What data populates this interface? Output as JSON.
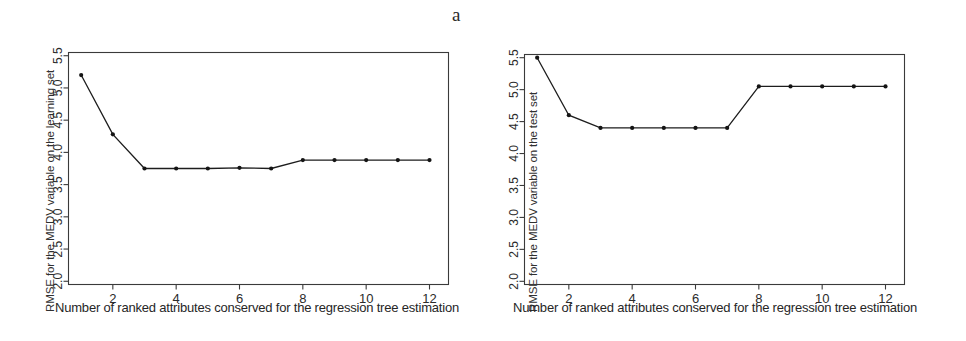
{
  "figure": {
    "panels": [
      {
        "id": "a",
        "label": "a",
        "chart_data": {
          "type": "line",
          "title": "",
          "xlabel": "Number of ranked attributes conserved for the regression tree estimation",
          "ylabel": "RMSE for the MEDV variable on the learning set",
          "x": [
            1,
            2,
            3,
            4,
            5,
            6,
            7,
            8,
            9,
            10,
            11,
            12
          ],
          "values": [
            5.2,
            4.28,
            3.75,
            3.75,
            3.75,
            3.76,
            3.75,
            3.88,
            3.88,
            3.88,
            3.88,
            3.88
          ],
          "xlim": [
            0.6,
            12.6
          ],
          "ylim": [
            1.95,
            5.55
          ],
          "xticks": [
            2,
            4,
            6,
            8,
            10,
            12
          ],
          "xtick_labels": [
            "2",
            "4",
            "6",
            "8",
            "10",
            "12"
          ],
          "yticks": [
            2.0,
            2.5,
            3.0,
            3.5,
            4.0,
            4.5,
            5.0,
            5.5
          ],
          "ytick_labels": [
            "2.0",
            "2.5",
            "3.0",
            "3.5",
            "4.0",
            "4.5",
            "5.0",
            "5.5"
          ],
          "grid": false,
          "legend": false,
          "marker": "filled-circle",
          "line_color": "#1d1d1d"
        }
      },
      {
        "id": "b",
        "label": "b",
        "chart_data": {
          "type": "line",
          "title": "",
          "xlabel": "Number of ranked attributes conserved for the regression tree estimation",
          "ylabel": "RMSE for the MEDV variable on the test set",
          "x": [
            1,
            2,
            3,
            4,
            5,
            6,
            7,
            8,
            9,
            10,
            11,
            12
          ],
          "values": [
            5.5,
            4.6,
            4.4,
            4.4,
            4.4,
            4.4,
            4.4,
            5.05,
            5.05,
            5.05,
            5.05,
            5.05
          ],
          "xlim": [
            0.6,
            12.6
          ],
          "ylim": [
            1.95,
            5.55
          ],
          "xticks": [
            2,
            4,
            6,
            8,
            10,
            12
          ],
          "xtick_labels": [
            "2",
            "4",
            "6",
            "8",
            "10",
            "12"
          ],
          "yticks": [
            2.0,
            2.5,
            3.0,
            3.5,
            4.0,
            4.5,
            5.0,
            5.5
          ],
          "ytick_labels": [
            "2.0",
            "2.5",
            "3.0",
            "3.5",
            "4.0",
            "4.5",
            "5.0",
            "5.5"
          ],
          "grid": false,
          "legend": false,
          "marker": "filled-circle",
          "line_color": "#1d1d1d"
        }
      }
    ]
  }
}
